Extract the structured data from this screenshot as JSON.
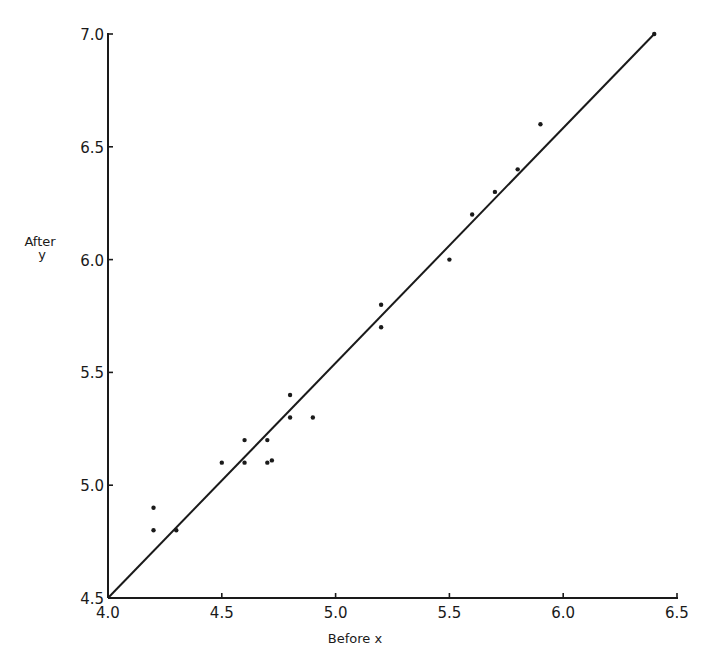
{
  "chart_data": {
    "type": "scatter",
    "title": "",
    "xlabel": "Before  x",
    "ylabel": "After\ny",
    "ylabel_lines": [
      "After",
      "y"
    ],
    "xlim": [
      4.0,
      6.5
    ],
    "ylim": [
      4.5,
      7.0
    ],
    "xticks": [
      4.0,
      4.5,
      5.0,
      5.5,
      6.0,
      6.5
    ],
    "yticks": [
      4.5,
      5.0,
      5.5,
      6.0,
      6.5,
      7.0
    ],
    "xtick_labels": [
      "4.0",
      "4.5",
      "5.0",
      "5.5",
      "6.0",
      "6.5"
    ],
    "ytick_labels": [
      "4.5",
      "5.0",
      "5.5",
      "6.0",
      "6.5",
      "7.0"
    ],
    "grid": false,
    "legend": null,
    "series": [
      {
        "name": "observations",
        "marker": "dot",
        "x": [
          4.2,
          4.2,
          4.3,
          4.5,
          4.6,
          4.6,
          4.7,
          4.7,
          4.72,
          4.8,
          4.8,
          4.9,
          5.2,
          5.2,
          5.5,
          5.6,
          5.7,
          5.8,
          5.9,
          6.4
        ],
        "y": [
          4.9,
          4.8,
          4.8,
          5.1,
          5.2,
          5.1,
          5.2,
          5.1,
          5.11,
          5.4,
          5.3,
          5.3,
          5.8,
          5.7,
          6.0,
          6.2,
          6.3,
          6.4,
          6.6,
          7.0
        ]
      },
      {
        "name": "fitted line",
        "type": "line",
        "x": [
          4.0,
          6.4
        ],
        "y": [
          4.5,
          7.0
        ]
      }
    ]
  },
  "colors": {
    "ink": "#1a1a1a",
    "background": "#ffffff"
  }
}
